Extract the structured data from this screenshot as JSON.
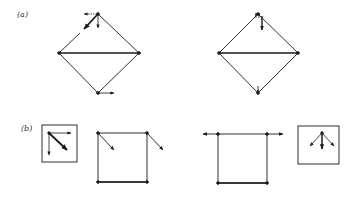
{
  "figure": {
    "panels": [
      {
        "id": "a",
        "label": "(a)",
        "shapes": [
          {
            "type": "diamond-with-horizontal-diagonal",
            "position": "left",
            "vectors": [
              "top: leftward dotted arrow",
              "top: downward arrow",
              "top: bold diagonal down-left arrow",
              "bottom: rightward arrow"
            ]
          },
          {
            "type": "diamond-with-horizontal-diagonal",
            "position": "right",
            "vectors": [
              "top: bold downward arrow",
              "top: small upward arrows",
              "bottom: small downward arrow"
            ]
          }
        ]
      },
      {
        "id": "b",
        "label": "(b)",
        "shapes": [
          {
            "type": "inset-box",
            "position": "left",
            "vectors": [
              "rightward arrow",
              "downward arrow",
              "bold diagonal down-right arrow"
            ]
          },
          {
            "type": "square-frame",
            "position": "center-left",
            "vectors": [
              "top-left: diagonal down-right arrow",
              "top-right: diagonal down-right arrow"
            ]
          },
          {
            "type": "square-frame",
            "position": "center-right",
            "vectors": [
              "top-left: leftward arrow",
              "top-right: rightward arrow"
            ]
          },
          {
            "type": "inset-box",
            "position": "right",
            "vectors": [
              "bold downward arrow",
              "down-left arrow",
              "down-right arrow"
            ]
          }
        ]
      }
    ]
  },
  "colors": {
    "ink": "#1a1a1a",
    "background": "#ffffff"
  }
}
